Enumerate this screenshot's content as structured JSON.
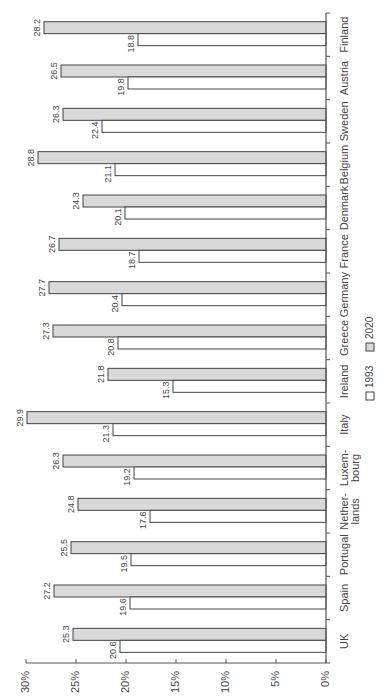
{
  "chart_data": {
    "type": "bar",
    "orientation": "horizontal-rotated",
    "title": "",
    "xlabel": "",
    "ylabel": "",
    "categories": [
      "UK",
      "Spain",
      "Portugal",
      "Nether-lands",
      "Luxem-bourg",
      "Italy",
      "Ireland",
      "Greece",
      "Germany",
      "France",
      "Denmark",
      "Belgium",
      "Sweden",
      "Austria",
      "Finland"
    ],
    "category_lines": [
      [
        "UK"
      ],
      [
        "Spain"
      ],
      [
        "Portugal"
      ],
      [
        "Nether-",
        "lands"
      ],
      [
        "Luxem-",
        "bourg"
      ],
      [
        "Italy"
      ],
      [
        "Ireland"
      ],
      [
        "Greece"
      ],
      [
        "Germany"
      ],
      [
        "France"
      ],
      [
        "Denmark"
      ],
      [
        "Belgium"
      ],
      [
        "Sweden"
      ],
      [
        "Austria"
      ],
      [
        "Finland"
      ]
    ],
    "series": [
      {
        "name": "1993",
        "color": "#ffffff",
        "values": [
          20.6,
          19.6,
          19.5,
          17.6,
          19.2,
          21.3,
          15.3,
          20.8,
          20.4,
          18.7,
          20.1,
          21.1,
          22.4,
          19.8,
          18.8
        ]
      },
      {
        "name": "2020",
        "color": "#d9d9d9",
        "values": [
          25.3,
          27.2,
          25.5,
          24.8,
          26.3,
          29.9,
          21.8,
          27.3,
          27.7,
          26.7,
          24.3,
          28.8,
          26.3,
          26.5,
          28.2
        ]
      }
    ],
    "value_axis": {
      "ticks": [
        "0%",
        "5%",
        "10%",
        "15%",
        "20%",
        "25%",
        "30%"
      ],
      "tick_values": [
        0,
        5,
        10,
        15,
        20,
        25,
        30
      ],
      "range": [
        0,
        30
      ]
    },
    "legend": {
      "position": "right",
      "entries": [
        "1993",
        "2020"
      ]
    },
    "grid": false
  }
}
